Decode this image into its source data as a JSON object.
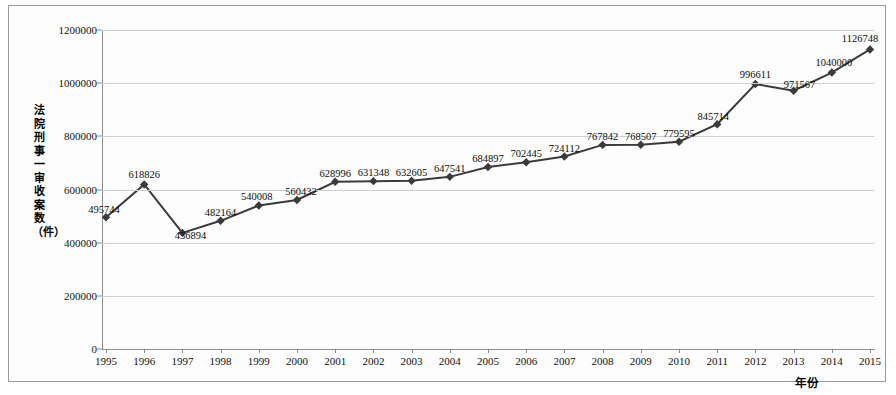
{
  "chart_data": {
    "type": "line",
    "title": "",
    "xlabel": "年份",
    "ylabel": "法院刑事一审收案数（件）",
    "categories": [
      "1995",
      "1996",
      "1997",
      "1998",
      "1999",
      "2000",
      "2001",
      "2002",
      "2003",
      "2004",
      "2005",
      "2006",
      "2007",
      "2008",
      "2009",
      "2010",
      "2011",
      "2012",
      "2013",
      "2014",
      "2015"
    ],
    "values": [
      495744,
      618826,
      436894,
      482164,
      540008,
      560432,
      628996,
      631348,
      632605,
      647541,
      684897,
      702445,
      724112,
      767842,
      768507,
      779595,
      845714,
      996611,
      971567,
      1040000,
      1126748
    ],
    "ylim": [
      0,
      1200000
    ],
    "yticks": [
      "0",
      "200000",
      "400000",
      "600000",
      "800000",
      "1000000",
      "1200000"
    ],
    "ytick_values": [
      0,
      200000,
      400000,
      600000,
      800000,
      1000000,
      1200000
    ],
    "grid": true,
    "legend": "none",
    "series_color": "#3a3a3a",
    "marker": "diamond",
    "gridline_color": "#cfcfcf",
    "axis_color": "#8d8d8d",
    "data_labels": [
      "495744",
      "618826",
      "436894",
      "482164",
      "540008",
      "560432",
      "628996",
      "631348",
      "632605",
      "647541",
      "684897",
      "702445",
      "724112",
      "767842",
      "768507",
      "779595",
      "845714",
      "996611",
      "971567",
      "1040000",
      "1126748"
    ]
  }
}
